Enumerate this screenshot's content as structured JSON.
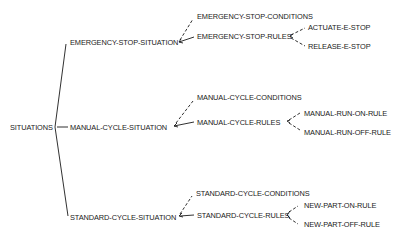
{
  "diagram": {
    "type": "tree",
    "root": {
      "label": "SITUATIONS"
    },
    "situations": [
      {
        "label": "EMERGENCY-STOP-SITUATION",
        "conditions": "EMERGENCY-STOP-CONDITIONS",
        "rules": "EMERGENCY-STOP-RULES",
        "rule_items": [
          "ACTUATE-E-STOP",
          "RELEASE-E-STOP"
        ]
      },
      {
        "label": "MANUAL-CYCLE-SITUATION",
        "conditions": "MANUAL-CYCLE-CONDITIONS",
        "rules": "MANUAL-CYCLE-RULES",
        "rule_items": [
          "MANUAL-RUN-ON-RULE",
          "MANUAL-RUN-OFF-RULE"
        ]
      },
      {
        "label": "STANDARD-CYCLE-SITUATION",
        "conditions": "STANDARD-CYCLE-CONDITIONS",
        "rules": "STANDARD-CYCLE-RULES",
        "rule_items": [
          "NEW-PART-ON-RULE",
          "NEW-PART-OFF-RULE"
        ]
      }
    ],
    "colors": {
      "line": "#1a1a1a",
      "text": "#1a1a1a",
      "background": "#ffffff"
    }
  }
}
